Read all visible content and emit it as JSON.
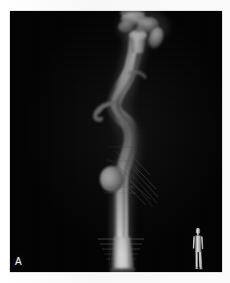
{
  "figure": {
    "panel_label": "A",
    "modality_name": "ct-angiography-volume-rendering",
    "background_color": "#ffffff",
    "panel_color": "#020202",
    "vessel_color": "#d9d9d9",
    "label_color": "#f2f2f2"
  },
  "panel": {
    "name": "volume-rendered-angiogram",
    "alt": "Three-dimensional volume-rendered CT angiogram showing a long tortuous contrast-filled artery running from top to bottom with branching vessels superiorly, a rounded saccular aneurysmal outpouching in the mid-lower segment, streak artifacts, and an oblique distal cut-off."
  },
  "annotations": {
    "corner_letter": "A",
    "orientation_marker": "standing-human-body-silhouette"
  },
  "structures": [
    {
      "name": "superior-branch-vessels",
      "label": "branching vessels at superior margin"
    },
    {
      "name": "tortuous-main-artery",
      "label": "tortuous contrast-filled main artery"
    },
    {
      "name": "small-side-branch",
      "label": "small hook-shaped side branch"
    },
    {
      "name": "saccular-aneurysm",
      "label": "rounded saccular outpouching"
    },
    {
      "name": "streak-artifact",
      "label": "linear beam-hardening streak artifact"
    },
    {
      "name": "distal-cutoff",
      "label": "distal oblique volume cut-off"
    }
  ]
}
